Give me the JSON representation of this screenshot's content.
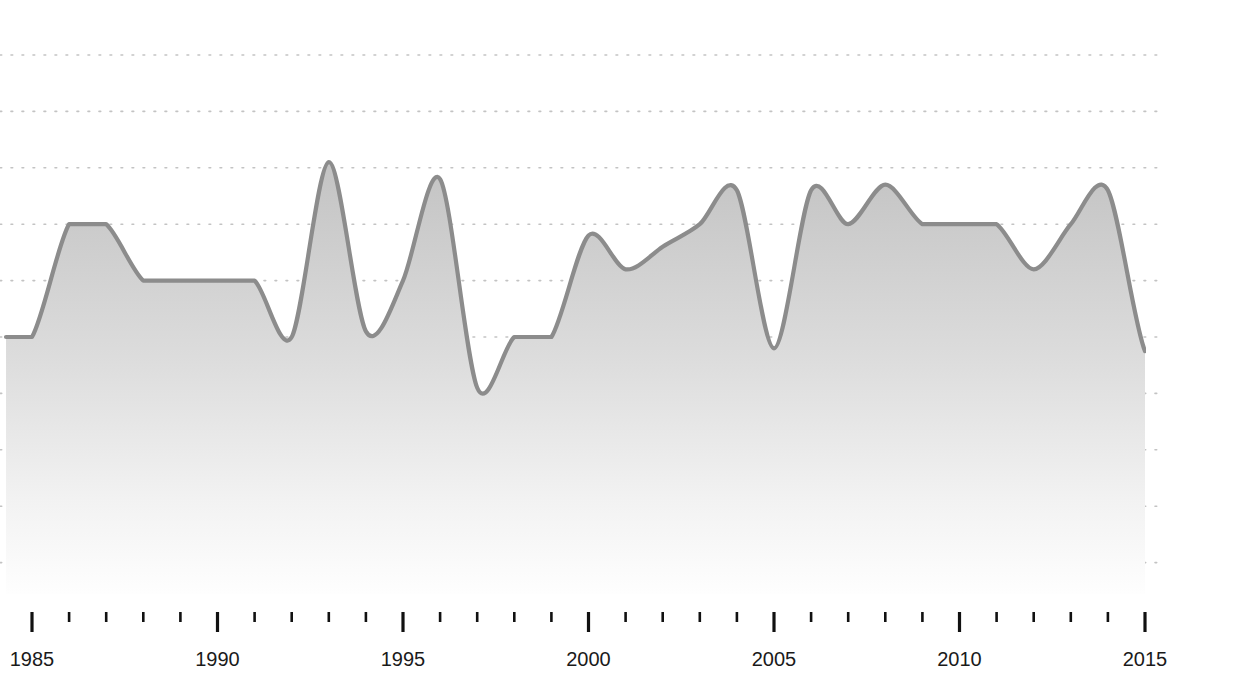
{
  "chart_data": {
    "type": "area",
    "title": "",
    "subtitle": "",
    "xlabel": "",
    "ylabel": "",
    "xlim": [
      1984.25,
      1985.0
    ],
    "ylim": [
      0,
      10
    ],
    "grid": true,
    "grid_style": "dotted-horizontal",
    "grid_count": 10,
    "legend": "none",
    "smoothing": "monotone-spline",
    "x": [
      1984.3,
      1985,
      1986,
      1987,
      1988,
      1989,
      1990,
      1991,
      1992,
      1993,
      1994,
      1995,
      1996,
      1997,
      1998,
      1999,
      2000,
      2001,
      2002,
      2003,
      2004,
      2005,
      2006,
      2007,
      2008,
      2009,
      2010,
      2011,
      2012,
      2013,
      2014,
      2015
    ],
    "categories": [
      "1984",
      "1985",
      "1986",
      "1987",
      "1988",
      "1989",
      "1990",
      "1991",
      "1992",
      "1993",
      "1994",
      "1995",
      "1996",
      "1997",
      "1998",
      "1999",
      "2000",
      "2001",
      "2002",
      "2003",
      "2004",
      "2005",
      "2006",
      "2007",
      "2008",
      "2009",
      "2010",
      "2011",
      "2012",
      "2013",
      "2014",
      "2015"
    ],
    "values": [
      4.0,
      4.0,
      6.0,
      6.0,
      5.0,
      5.0,
      5.0,
      5.0,
      4.0,
      7.1,
      4.1,
      5.0,
      6.8,
      3.1,
      4.0,
      4.0,
      5.8,
      5.2,
      5.6,
      6.0,
      6.6,
      3.8,
      6.6,
      6.0,
      6.7,
      6.0,
      6.0,
      6.0,
      5.2,
      6.0,
      6.6,
      3.75
    ],
    "series": [
      {
        "name": "value",
        "values": [
          4.0,
          4.0,
          6.0,
          6.0,
          5.0,
          5.0,
          5.0,
          5.0,
          4.0,
          7.1,
          4.1,
          5.0,
          6.8,
          3.1,
          4.0,
          4.0,
          5.8,
          5.2,
          5.6,
          6.0,
          6.6,
          3.8,
          6.6,
          6.0,
          6.7,
          6.0,
          6.0,
          6.0,
          5.2,
          6.0,
          6.6,
          3.75
        ],
        "line_color": "#8c8c8c",
        "fill_color": "#c9c9c9"
      }
    ],
    "x_major_ticks": [
      1985,
      1990,
      1995,
      2000,
      2005,
      2010,
      2015
    ],
    "x_major_tick_labels": [
      "1985",
      "1990",
      "1995",
      "2000",
      "2005",
      "2010",
      "2015"
    ],
    "x_minor_ticks": [
      1986,
      1987,
      1988,
      1989,
      1991,
      1992,
      1993,
      1994,
      1996,
      1997,
      1998,
      1999,
      2001,
      2002,
      2003,
      2004,
      2006,
      2007,
      2008,
      2009,
      2011,
      2012,
      2013,
      2014
    ],
    "y_gridline_values": [
      9,
      8,
      7,
      6,
      5,
      4,
      3,
      2,
      1,
      0
    ],
    "y_tick_labels": []
  },
  "colors": {
    "background": "#ffffff",
    "line": "#8c8c8c",
    "area_top": "#c6c6c6",
    "area_bottom": "#fdfdfd",
    "gridline": "#c3c3c3",
    "tick": "#111111",
    "tick_label": "#1a1a1a"
  },
  "axis": {
    "x_labels": [
      "1985",
      "1990",
      "1995",
      "2000",
      "2005",
      "2010",
      "2015"
    ]
  }
}
